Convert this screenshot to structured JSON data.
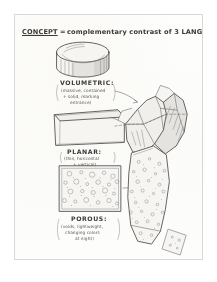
{
  "document": {
    "kind": "hand-drawn architectural concept sketch",
    "medium": "pencil on white paper",
    "title_line": {
      "keyword": "CONCEPT",
      "separator": "=",
      "rest": "complementary contrast of 3 LANGUAGES:"
    }
  },
  "annotations": {
    "volumetric": {
      "label": "VOLUMETRIC:",
      "notes": [
        "(massive, contained",
        "+ solid, marking",
        "entrance)"
      ]
    },
    "planar": {
      "label": "PLANAR:",
      "notes": [
        "(thin, horizontal",
        "+ vertical)"
      ]
    },
    "porous": {
      "label": "POROUS:",
      "notes": [
        "(voids, lightweight,",
        "changing colors",
        "at night)"
      ]
    }
  },
  "figures": {
    "left_column": [
      {
        "name": "cylinder",
        "represents": "VOLUMETRIC",
        "shading": "hatched side, light top ellipse"
      },
      {
        "name": "plane-slab",
        "represents": "PLANAR",
        "shading": "outline box, thin top edge"
      },
      {
        "name": "porous-square",
        "represents": "POROUS",
        "shading": "square filled with small circles"
      }
    ],
    "right_column": [
      {
        "name": "faceted-rock-mass",
        "represents": "massing study, upper building form"
      },
      {
        "name": "dotted-tower",
        "represents": "porous vertical element, lower"
      }
    ],
    "leaders": [
      {
        "from": "volumetric-note",
        "to": "faceted-rock-mass"
      },
      {
        "from": "planar-figure",
        "to": "faceted-rock-mass"
      },
      {
        "from": "porous-figure",
        "to": "dotted-tower"
      }
    ]
  },
  "colors": {
    "paper": "#fdfdfc",
    "ink": "#4a4a4a",
    "ink_soft": "#6d6d6d",
    "border": "#d8d8d6",
    "shade_light": "#f0efec",
    "shade_mid": "#e4e3df",
    "shade_dark": "#d6d5d0"
  }
}
